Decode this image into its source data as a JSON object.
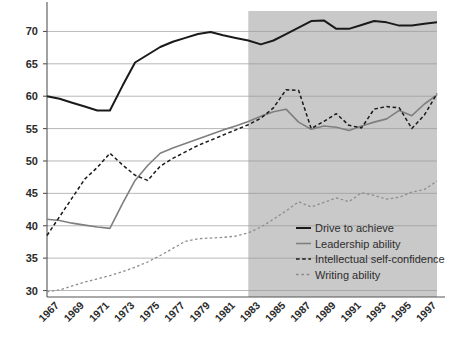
{
  "chart_data": {
    "type": "line",
    "title": "",
    "subtitle": "",
    "xlabel": "",
    "ylabel": "",
    "xlim": [
      1966,
      1997
    ],
    "ylim": [
      29,
      73
    ],
    "yticks": [
      30,
      35,
      40,
      45,
      50,
      55,
      60,
      65,
      70
    ],
    "ytick_labels": [
      "30",
      "35",
      "40",
      "45",
      "50",
      "55",
      "60",
      "65",
      "70"
    ],
    "grid": true,
    "grid_axis": "y",
    "legend_position": "inside-lower-right",
    "x": [
      1966,
      1967,
      1968,
      1969,
      1970,
      1971,
      1972,
      1973,
      1974,
      1975,
      1976,
      1977,
      1978,
      1979,
      1980,
      1981,
      1982,
      1983,
      1984,
      1985,
      1986,
      1987,
      1988,
      1989,
      1990,
      1991,
      1992,
      1993,
      1994,
      1995,
      1996,
      1997
    ],
    "xticks": [
      1967,
      1969,
      1971,
      1973,
      1975,
      1977,
      1979,
      1981,
      1983,
      1985,
      1987,
      1989,
      1991,
      1993,
      1995,
      1997
    ],
    "xtick_labels": [
      "1967",
      "1969",
      "1971",
      "1973",
      "1975",
      "1977",
      "1979",
      "1981",
      "1983",
      "1985",
      "1987",
      "1989",
      "1991",
      "1993",
      "1995",
      "1997"
    ],
    "shaded_region": {
      "from": 1982,
      "to": 1997,
      "color": "#c9c9c9"
    },
    "series": [
      {
        "name": "Drive to achieve",
        "key": "drive",
        "color": "#1a1a1a",
        "style": "solid",
        "width": 2.0,
        "values": [
          60.0,
          59.6,
          59.0,
          58.4,
          57.8,
          57.8,
          61.6,
          65.2,
          66.4,
          67.6,
          68.4,
          69.0,
          69.6,
          69.9,
          69.4,
          69.0,
          68.6,
          68.0,
          68.6,
          69.6,
          70.6,
          71.6,
          71.7,
          70.4,
          70.4,
          71.0,
          71.6,
          71.4,
          70.9,
          70.9,
          71.2,
          71.4
        ]
      },
      {
        "name": "Leadership ability",
        "key": "leadership",
        "color": "#7f7f7f",
        "style": "solid",
        "width": 1.6,
        "values": [
          41.0,
          40.8,
          40.4,
          40.1,
          39.8,
          39.6,
          43.4,
          47.0,
          49.3,
          51.2,
          52.0,
          52.7,
          53.4,
          54.1,
          54.8,
          55.4,
          56.1,
          56.9,
          57.6,
          58.0,
          56.0,
          54.9,
          55.4,
          55.2,
          54.7,
          55.4,
          56.0,
          56.5,
          57.8,
          57.0,
          58.8,
          60.2
        ]
      },
      {
        "name": "Intellectual self-confidence",
        "key": "intellectual",
        "color": "#1a1a1a",
        "style": "dashed",
        "width": 1.5,
        "values": [
          38.5,
          41.4,
          44.3,
          47.2,
          49.0,
          51.2,
          49.4,
          47.8,
          47.0,
          49.2,
          50.4,
          51.4,
          52.4,
          53.2,
          54.0,
          54.8,
          55.6,
          56.6,
          58.2,
          61.0,
          60.9,
          55.0,
          56.1,
          57.3,
          55.5,
          55.1,
          58.0,
          58.4,
          58.2,
          55.0,
          57.1,
          60.4
        ]
      },
      {
        "name": "Writing ability",
        "key": "writing",
        "color": "#8c8c8c",
        "style": "dotted",
        "width": 1.3,
        "values": [
          29.8,
          30.1,
          30.7,
          31.3,
          31.8,
          32.3,
          32.9,
          33.6,
          34.4,
          35.4,
          36.5,
          37.6,
          38.0,
          38.1,
          38.2,
          38.4,
          38.9,
          39.8,
          41.0,
          42.3,
          43.7,
          42.9,
          43.6,
          44.3,
          43.7,
          45.1,
          44.7,
          44.1,
          44.4,
          45.2,
          45.6,
          46.9
        ]
      }
    ]
  },
  "legend": {
    "items": [
      {
        "label": "Drive to achieve",
        "key": "drive"
      },
      {
        "label": "Leadership ability",
        "key": "leadership"
      },
      {
        "label": "Intellectual self-confidence",
        "key": "intellectual"
      },
      {
        "label": "Writing ability",
        "key": "writing"
      }
    ]
  },
  "axes": {
    "y_axis_color": "#555555",
    "grid_color": "#9a9a9a",
    "tick_color": "#555555"
  }
}
